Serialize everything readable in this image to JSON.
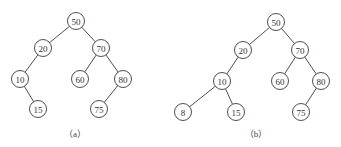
{
  "diagram": {
    "node_radius": 8.5,
    "trees": [
      {
        "id": "a",
        "caption": "（a）",
        "caption_pos": [
          75,
          134
        ],
        "nodes": [
          {
            "id": "a50",
            "label": "50",
            "x": 76,
            "y": 21
          },
          {
            "id": "a20",
            "label": "20",
            "x": 43,
            "y": 48
          },
          {
            "id": "a70",
            "label": "70",
            "x": 101,
            "y": 48
          },
          {
            "id": "a10",
            "label": "10",
            "x": 20,
            "y": 79
          },
          {
            "id": "a60",
            "label": "60",
            "x": 80,
            "y": 79
          },
          {
            "id": "a80",
            "label": "80",
            "x": 123,
            "y": 79
          },
          {
            "id": "a15",
            "label": "15",
            "x": 38,
            "y": 109
          },
          {
            "id": "a75",
            "label": "75",
            "x": 99,
            "y": 109
          }
        ],
        "edges": [
          [
            "a50",
            "a20"
          ],
          [
            "a50",
            "a70"
          ],
          [
            "a20",
            "a10"
          ],
          [
            "a70",
            "a60"
          ],
          [
            "a70",
            "a80"
          ],
          [
            "a10",
            "a15"
          ],
          [
            "a80",
            "a75"
          ]
        ]
      },
      {
        "id": "b",
        "caption": "（b）",
        "caption_pos": [
          256,
          134
        ],
        "nodes": [
          {
            "id": "b50",
            "label": "50",
            "x": 276,
            "y": 22
          },
          {
            "id": "b20",
            "label": "20",
            "x": 243,
            "y": 50
          },
          {
            "id": "b70",
            "label": "70",
            "x": 300,
            "y": 50
          },
          {
            "id": "b10",
            "label": "10",
            "x": 222,
            "y": 81
          },
          {
            "id": "b60",
            "label": "60",
            "x": 280,
            "y": 81
          },
          {
            "id": "b80",
            "label": "80",
            "x": 321,
            "y": 81
          },
          {
            "id": "b8",
            "label": "8",
            "x": 183,
            "y": 112
          },
          {
            "id": "b15",
            "label": "15",
            "x": 236,
            "y": 112
          },
          {
            "id": "b75",
            "label": "75",
            "x": 301,
            "y": 112
          }
        ],
        "edges": [
          [
            "b50",
            "b20"
          ],
          [
            "b50",
            "b70"
          ],
          [
            "b20",
            "b10"
          ],
          [
            "b70",
            "b60"
          ],
          [
            "b70",
            "b80"
          ],
          [
            "b10",
            "b8"
          ],
          [
            "b10",
            "b15"
          ],
          [
            "b80",
            "b75"
          ]
        ]
      }
    ]
  }
}
